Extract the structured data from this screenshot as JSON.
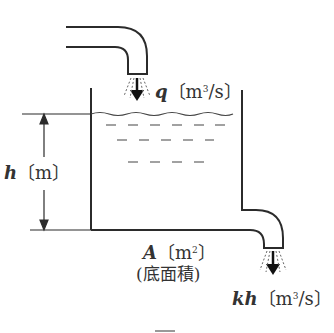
{
  "diagram": {
    "type": "water-tank",
    "colors": {
      "line": "#2b2b2b",
      "text": "#333333"
    },
    "inflow": {
      "symbol": "q",
      "unit_pre": "〔m",
      "unit_exp": "3",
      "unit_post": "/s〕"
    },
    "height": {
      "symbol": "h",
      "unit": "〔m〕"
    },
    "area": {
      "symbol": "A",
      "unit_pre": "〔m",
      "unit_exp": "2",
      "unit_post": "〕",
      "note": "(底面積)"
    },
    "outflow": {
      "symbol": "kh",
      "unit_pre": "〔m",
      "unit_exp": "3",
      "unit_post": "/s〕"
    },
    "caption": "図"
  }
}
